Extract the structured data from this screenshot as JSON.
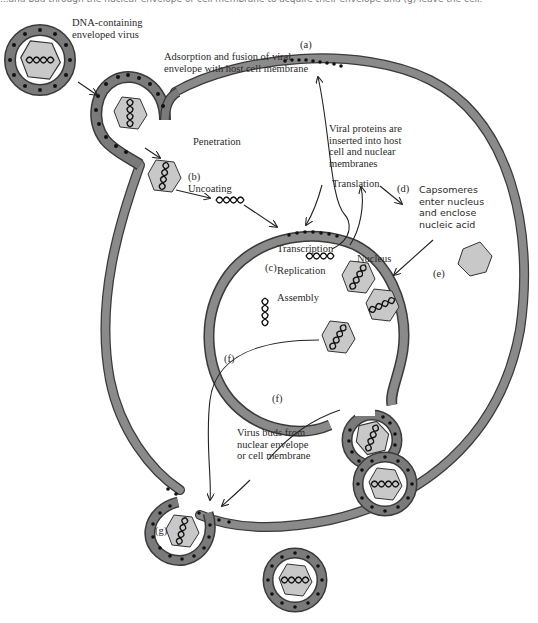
{
  "caption": "...and bud through the nuclear envelope or cell membrane to acquire their envelope and (g) leave the cell.",
  "colors": {
    "membrane": "#7a7a7a",
    "membrane_edge": "#3a3a3a",
    "capsid": "#c8c8c8",
    "dots": "#111111",
    "background": "#ffffff"
  },
  "labels": {
    "virus": "DNA-containing\nenveloped virus",
    "step_a": "(a)",
    "adsorption": "Adsorption and fusion of viral\nenvelope with host cell membrane",
    "penetration": "Penetration",
    "step_b": "(b)",
    "uncoating": "Uncoating",
    "viral_proteins": "Viral proteins are\ninserted into host\ncell and nuclear\nmembranes",
    "translation": "Translation",
    "step_d": "(d)",
    "capsomeres": "Capsomeres\nenter nucleus\nand enclose\nnucleic acid",
    "transcription": "Transcription",
    "step_c": "(c)",
    "replication": "Replication",
    "nucleus": "Nucleus",
    "assembly": "Assembly",
    "step_e": "(e)",
    "step_f1": "(f)",
    "step_f2": "(f)",
    "virus_buds": "Virus buds from\nnuclear envelope\nor cell membrane",
    "step_g": "(g)"
  }
}
